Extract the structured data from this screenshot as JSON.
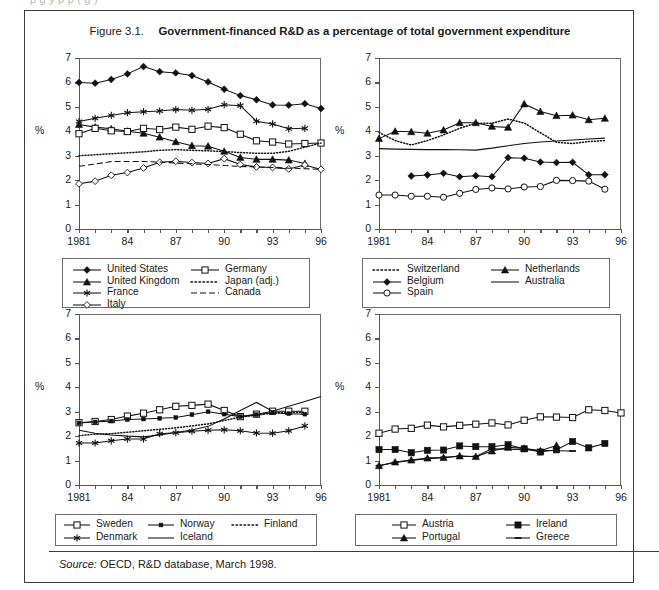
{
  "top_cut_text": "p          g                 y                                                                p      p   ( g      )",
  "figure": {
    "label": "Figure 3.1.",
    "title": "Government-financed R&D as a percentage of total government expenditure"
  },
  "source": {
    "label": "Source:",
    "text": "OECD, R&D database, March 1998."
  },
  "axes": {
    "ylabel": "%",
    "yticks": [
      "0",
      "1",
      "2",
      "3",
      "4",
      "5",
      "6",
      "7"
    ],
    "ylim": [
      0,
      7
    ],
    "xlim": [
      1981,
      1996
    ],
    "xticks_labeled": [
      "1981",
      "84",
      "87",
      "90",
      "93",
      "96"
    ],
    "xtick_years": [
      1981,
      1982,
      1983,
      1984,
      1985,
      1986,
      1987,
      1988,
      1989,
      1990,
      1991,
      1992,
      1993,
      1994,
      1995,
      1996
    ]
  },
  "chart_data": [
    {
      "id": "panel-a",
      "type": "line",
      "title": "",
      "xlabel": "",
      "ylabel": "%",
      "xlim": [
        1981,
        1996
      ],
      "ylim": [
        0,
        7
      ],
      "grid": false,
      "legend_position": "below",
      "x": [
        1981,
        1982,
        1983,
        1984,
        1985,
        1986,
        1987,
        1988,
        1989,
        1990,
        1991,
        1992,
        1993,
        1994,
        1995,
        1996
      ],
      "series": [
        {
          "name": "United States",
          "marker": "filled-diamond",
          "line": "solid",
          "values": [
            6.0,
            5.97,
            6.12,
            6.35,
            6.65,
            6.44,
            6.39,
            6.28,
            6.02,
            5.72,
            5.46,
            5.29,
            5.08,
            5.07,
            5.13,
            4.93
          ]
        },
        {
          "name": "United Kingdom",
          "marker": "filled-triangle",
          "line": "solid",
          "values": [
            4.28,
            4.17,
            4.1,
            4.0,
            3.92,
            3.76,
            3.57,
            3.41,
            3.39,
            3.18,
            2.93,
            2.85,
            2.85,
            2.82,
            2.68,
            null
          ]
        },
        {
          "name": "France",
          "marker": "asterisk",
          "line": "solid",
          "values": [
            4.4,
            4.53,
            4.65,
            4.76,
            4.8,
            4.83,
            4.89,
            4.86,
            4.9,
            5.09,
            5.05,
            4.41,
            4.3,
            4.1,
            4.12,
            null
          ]
        },
        {
          "name": "Italy",
          "marker": "open-diamond",
          "line": "solid",
          "values": [
            1.85,
            1.96,
            2.2,
            2.31,
            2.5,
            2.73,
            2.77,
            2.72,
            2.68,
            2.88,
            2.64,
            2.54,
            2.52,
            2.46,
            2.62,
            2.44
          ]
        },
        {
          "name": "Germany",
          "marker": "open-square",
          "line": "solid",
          "values": [
            3.9,
            4.12,
            4.02,
            3.99,
            4.12,
            4.07,
            4.17,
            4.08,
            4.21,
            4.15,
            3.88,
            3.61,
            3.56,
            3.48,
            3.5,
            3.52
          ]
        },
        {
          "name": "Japan (adj.)",
          "marker": "none",
          "line": "dotted",
          "values": [
            3.0,
            3.04,
            3.08,
            3.12,
            3.16,
            3.22,
            3.25,
            3.22,
            3.2,
            3.17,
            3.13,
            3.1,
            3.1,
            3.18,
            3.35,
            3.52
          ]
        },
        {
          "name": "Canada",
          "marker": "none",
          "line": "dashed",
          "values": [
            2.57,
            2.66,
            2.76,
            2.76,
            2.76,
            2.74,
            2.7,
            2.67,
            2.64,
            2.6,
            2.56,
            2.54,
            2.52,
            2.49,
            2.47,
            2.44
          ]
        }
      ]
    },
    {
      "id": "panel-b",
      "type": "line",
      "title": "",
      "xlabel": "",
      "ylabel": "%",
      "xlim": [
        1981,
        1996
      ],
      "ylim": [
        0,
        7
      ],
      "grid": false,
      "legend_position": "below",
      "x": [
        1981,
        1982,
        1983,
        1984,
        1985,
        1986,
        1987,
        1988,
        1989,
        1990,
        1991,
        1992,
        1993,
        1994,
        1995,
        1996
      ],
      "series": [
        {
          "name": "Switzerland",
          "marker": "none",
          "line": "dotted",
          "values": [
            3.95,
            3.62,
            3.44,
            3.62,
            3.85,
            4.12,
            4.33,
            4.33,
            4.5,
            4.34,
            3.94,
            3.55,
            3.5,
            3.58,
            3.62,
            null
          ]
        },
        {
          "name": "Netherlands",
          "marker": "filled-triangle",
          "line": "solid",
          "values": [
            3.7,
            4.0,
            3.98,
            3.92,
            4.05,
            4.35,
            4.35,
            4.2,
            4.16,
            5.12,
            4.81,
            4.64,
            4.66,
            4.47,
            4.53,
            null
          ]
        },
        {
          "name": "Belgium",
          "marker": "filled-diamond",
          "line": "solid",
          "values": [
            null,
            null,
            2.17,
            2.21,
            2.28,
            2.14,
            2.18,
            2.14,
            2.92,
            2.9,
            2.74,
            2.72,
            2.73,
            2.22,
            2.22,
            null
          ]
        },
        {
          "name": "Australia",
          "marker": "none",
          "line": "solid",
          "values": [
            3.29,
            3.27,
            3.26,
            3.25,
            3.25,
            3.24,
            3.23,
            3.31,
            3.41,
            3.5,
            3.56,
            3.6,
            3.64,
            3.68,
            3.72,
            null
          ]
        },
        {
          "name": "Spain",
          "marker": "open-circle",
          "line": "solid",
          "values": [
            1.39,
            1.39,
            1.34,
            1.34,
            1.3,
            1.46,
            1.62,
            1.68,
            1.64,
            1.72,
            1.74,
            1.99,
            1.98,
            1.96,
            1.63,
            null
          ]
        }
      ]
    },
    {
      "id": "panel-c",
      "type": "line",
      "title": "",
      "xlabel": "",
      "ylabel": "%",
      "xlim": [
        1981,
        1996
      ],
      "ylim": [
        0,
        7
      ],
      "grid": false,
      "legend_position": "below",
      "x": [
        1981,
        1982,
        1983,
        1984,
        1985,
        1986,
        1987,
        1988,
        1989,
        1990,
        1991,
        1992,
        1993,
        1994,
        1995,
        1996
      ],
      "series": [
        {
          "name": "Sweden",
          "marker": "open-square",
          "line": "solid",
          "values": [
            2.55,
            2.6,
            2.68,
            2.82,
            2.94,
            3.08,
            3.22,
            3.26,
            3.31,
            3.05,
            2.8,
            2.9,
            3.02,
            3.02,
            3.02,
            null
          ]
        },
        {
          "name": "Norway",
          "marker": "small-filled-square",
          "line": "solid",
          "values": [
            2.54,
            2.58,
            2.62,
            2.68,
            2.7,
            2.73,
            2.76,
            2.88,
            3.0,
            2.9,
            2.8,
            2.88,
            2.96,
            2.92,
            2.9,
            null
          ]
        },
        {
          "name": "Finland",
          "marker": "none",
          "line": "dotted",
          "values": [
            2.02,
            2.08,
            2.1,
            2.16,
            2.22,
            2.28,
            2.34,
            2.42,
            2.5,
            2.64,
            2.78,
            2.86,
            2.95,
            2.96,
            2.98,
            null
          ]
        },
        {
          "name": "Denmark",
          "marker": "asterisk",
          "line": "solid",
          "values": [
            1.72,
            1.72,
            1.81,
            1.88,
            1.88,
            2.1,
            2.14,
            2.2,
            2.24,
            2.26,
            2.22,
            2.13,
            2.12,
            2.22,
            2.42,
            null
          ]
        },
        {
          "name": "Iceland",
          "marker": "none",
          "line": "solid",
          "values": [
            2.24,
            2.12,
            2.05,
            2.0,
            1.97,
            2.05,
            2.15,
            2.25,
            2.4,
            2.7,
            3.05,
            3.38,
            3.02,
            3.22,
            3.42,
            3.62
          ]
        }
      ]
    },
    {
      "id": "panel-d",
      "type": "line",
      "title": "",
      "xlabel": "",
      "ylabel": "%",
      "xlim": [
        1981,
        1996
      ],
      "ylim": [
        0,
        7
      ],
      "grid": false,
      "legend_position": "below",
      "x": [
        1981,
        1982,
        1983,
        1984,
        1985,
        1986,
        1987,
        1988,
        1989,
        1990,
        1991,
        1992,
        1993,
        1994,
        1995,
        1996
      ],
      "series": [
        {
          "name": "Austria",
          "marker": "open-square",
          "line": "solid",
          "values": [
            2.12,
            2.29,
            2.32,
            2.45,
            2.38,
            2.44,
            2.49,
            2.54,
            2.46,
            2.65,
            2.79,
            2.78,
            2.76,
            3.08,
            3.05,
            2.95
          ]
        },
        {
          "name": "Ireland",
          "marker": "filled-square",
          "line": "solid",
          "values": [
            1.45,
            1.45,
            1.32,
            1.42,
            1.43,
            1.6,
            1.57,
            1.57,
            1.65,
            1.48,
            1.35,
            1.44,
            1.78,
            1.52,
            1.7,
            null
          ]
        },
        {
          "name": "Portugal",
          "marker": "filled-triangle",
          "line": "solid",
          "values": [
            0.79,
            0.94,
            1.02,
            1.1,
            1.12,
            1.19,
            1.16,
            1.39,
            1.54,
            1.5,
            1.4,
            1.62,
            null,
            null,
            null,
            null
          ]
        },
        {
          "name": "Greece",
          "marker": "dash",
          "line": "solid",
          "values": [
            0.79,
            0.92,
            1.0,
            1.08,
            1.13,
            1.18,
            1.17,
            1.48,
            1.46,
            1.44,
            1.42,
            1.4,
            1.39,
            null,
            null,
            null
          ]
        }
      ]
    }
  ],
  "legends": [
    {
      "id": "legend-a",
      "entries": [
        {
          "label": "United States",
          "marker": "filled-diamond",
          "line": "solid",
          "col": 0,
          "row": 0
        },
        {
          "label": "United Kingdom",
          "marker": "filled-triangle",
          "line": "solid",
          "col": 0,
          "row": 1
        },
        {
          "label": "France",
          "marker": "asterisk",
          "line": "solid",
          "col": 0,
          "row": 2
        },
        {
          "label": "Italy",
          "marker": "open-diamond",
          "line": "solid",
          "col": 0,
          "row": 3
        },
        {
          "label": "Germany",
          "marker": "open-square",
          "line": "solid",
          "col": 1,
          "row": 0
        },
        {
          "label": "Japan (adj.)",
          "marker": "none",
          "line": "dotted",
          "col": 1,
          "row": 1
        },
        {
          "label": "Canada",
          "marker": "none",
          "line": "dashed",
          "col": 1,
          "row": 2
        }
      ]
    },
    {
      "id": "legend-b",
      "entries": [
        {
          "label": "Switzerland",
          "marker": "none",
          "line": "dotted",
          "col": 0,
          "row": 0
        },
        {
          "label": "Belgium",
          "marker": "filled-diamond",
          "line": "solid",
          "col": 0,
          "row": 1
        },
        {
          "label": "Spain",
          "marker": "open-circle",
          "line": "solid",
          "col": 0,
          "row": 2
        },
        {
          "label": "Netherlands",
          "marker": "filled-triangle",
          "line": "solid",
          "col": 1,
          "row": 0
        },
        {
          "label": "Australia",
          "marker": "none",
          "line": "solid",
          "col": 1,
          "row": 1
        }
      ]
    },
    {
      "id": "legend-c",
      "entries": [
        {
          "label": "Sweden",
          "marker": "open-square",
          "line": "solid",
          "col": 0,
          "row": 0
        },
        {
          "label": "Norway",
          "marker": "small-filled-square",
          "line": "solid",
          "col": 1,
          "row": 0
        },
        {
          "label": "Finland",
          "marker": "none",
          "line": "dotted",
          "col": 2,
          "row": 0
        },
        {
          "label": "Denmark",
          "marker": "asterisk",
          "line": "solid",
          "col": 0,
          "row": 1
        },
        {
          "label": "Iceland",
          "marker": "none",
          "line": "solid",
          "col": 1,
          "row": 1
        }
      ]
    },
    {
      "id": "legend-d",
      "entries": [
        {
          "label": "Austria",
          "marker": "open-square",
          "line": "solid",
          "col": 0,
          "row": 0
        },
        {
          "label": "Ireland",
          "marker": "filled-square",
          "line": "solid",
          "col": 1,
          "row": 0
        },
        {
          "label": "Portugal",
          "marker": "filled-triangle",
          "line": "solid",
          "col": 0,
          "row": 1
        },
        {
          "label": "Greece",
          "marker": "dash",
          "line": "solid",
          "col": 1,
          "row": 1
        }
      ]
    }
  ],
  "colors": {
    "ink": "#111111",
    "frame": "#3b3b3b",
    "axis": "#555555"
  }
}
